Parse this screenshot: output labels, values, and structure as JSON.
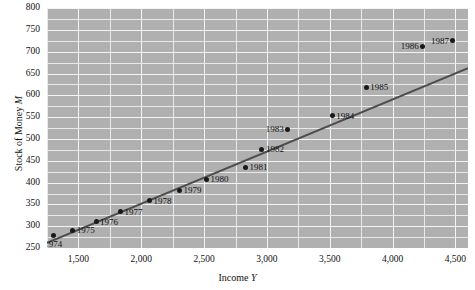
{
  "chart_data": {
    "type": "scatter",
    "title": "",
    "xlabel": "Income Y",
    "ylabel": "Stock of Money M",
    "xlim": [
      1250,
      4600
    ],
    "ylim": [
      250,
      800
    ],
    "grid": true,
    "legend": "none",
    "x_ticks": [
      1500,
      2000,
      2500,
      3000,
      3500,
      4000,
      4500
    ],
    "x_tick_labels": [
      "1,500",
      "2,000",
      "2,500",
      "3,000",
      "3,500",
      "4,000",
      "4,500"
    ],
    "y_ticks": [
      250,
      300,
      350,
      400,
      450,
      500,
      550,
      600,
      650,
      700,
      750,
      800
    ],
    "y_tick_labels": [
      "250",
      "300",
      "350",
      "400",
      "450",
      "500",
      "550",
      "600",
      "650",
      "700",
      "750",
      "800"
    ],
    "x_minor_step": 250,
    "y_minor_step": 25,
    "point_color": "#191919",
    "line_color": "#4d4d4d",
    "plot_background": "#b0b0b0",
    "gridline_color": "#e9e9e9",
    "points": [
      {
        "label": "1974",
        "x": 1300,
        "y": 279,
        "label_pos": "below"
      },
      {
        "label": "1975",
        "x": 1455,
        "y": 291,
        "label_pos": "right"
      },
      {
        "label": "1976",
        "x": 1640,
        "y": 310,
        "label_pos": "right"
      },
      {
        "label": "1977",
        "x": 1835,
        "y": 333,
        "label_pos": "right"
      },
      {
        "label": "1978",
        "x": 2065,
        "y": 358,
        "label_pos": "right"
      },
      {
        "label": "1979",
        "x": 2305,
        "y": 383,
        "label_pos": "right"
      },
      {
        "label": "1980",
        "x": 2520,
        "y": 408,
        "label_pos": "right"
      },
      {
        "label": "1981",
        "x": 2830,
        "y": 435,
        "label_pos": "right"
      },
      {
        "label": "1982",
        "x": 2960,
        "y": 476,
        "label_pos": "right"
      },
      {
        "label": "1983",
        "x": 3165,
        "y": 522,
        "label_pos": "left"
      },
      {
        "label": "1984",
        "x": 3520,
        "y": 553,
        "label_pos": "right"
      },
      {
        "label": "1985",
        "x": 3790,
        "y": 619,
        "label_pos": "right"
      },
      {
        "label": "1986",
        "x": 4240,
        "y": 712,
        "label_pos": "left"
      },
      {
        "label": "1987",
        "x": 4480,
        "y": 725,
        "label_pos": "left"
      }
    ],
    "fit_line": {
      "name": "regression line",
      "x_start": 1250,
      "y_start": 262,
      "x_end": 4600,
      "y_end": 662
    }
  }
}
